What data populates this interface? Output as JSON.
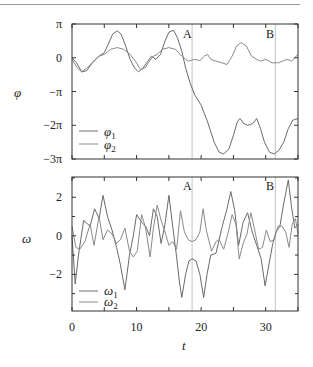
{
  "chart_data": [
    {
      "type": "line",
      "panel": "top",
      "ylabel": "φ",
      "xlabel": "",
      "xlim": [
        0,
        35
      ],
      "ylim_in_pi": [
        -3,
        1
      ],
      "yticks": [
        {
          "value_pi": 1,
          "label": "π"
        },
        {
          "value_pi": 0,
          "label": "0"
        },
        {
          "value_pi": -1,
          "label": "−π"
        },
        {
          "value_pi": -2,
          "label": "−2π"
        },
        {
          "value_pi": -3,
          "label": "−3π"
        }
      ],
      "xticks": [
        0,
        5,
        10,
        15,
        20,
        25,
        30,
        35
      ],
      "legend": {
        "position": "lower-left",
        "entries": [
          "φ1",
          "φ2"
        ]
      },
      "markers": [
        {
          "label": "A",
          "t": 18.6
        },
        {
          "label": "B",
          "t": 31.5
        }
      ],
      "series": [
        {
          "name": "φ1",
          "color": "#6a6a6a",
          "points_t_phi_over_pi": [
            [
              0,
              0
            ],
            [
              0.7,
              -0.15
            ],
            [
              1.5,
              -0.42
            ],
            [
              2.3,
              -0.38
            ],
            [
              3.2,
              -0.12
            ],
            [
              4.2,
              0.05
            ],
            [
              5,
              0.15
            ],
            [
              5.6,
              0.4
            ],
            [
              6.3,
              0.7
            ],
            [
              7,
              0.8
            ],
            [
              7.6,
              0.7
            ],
            [
              8.3,
              0.35
            ],
            [
              9,
              -0.05
            ],
            [
              9.7,
              -0.3
            ],
            [
              10.3,
              -0.42
            ],
            [
              11,
              -0.3
            ],
            [
              11.7,
              -0.12
            ],
            [
              12.3,
              0.05
            ],
            [
              13,
              -0.05
            ],
            [
              13.7,
              0.1
            ],
            [
              14.4,
              0.5
            ],
            [
              15,
              0.75
            ],
            [
              15.7,
              0.82
            ],
            [
              16.3,
              0.6
            ],
            [
              17,
              0.2
            ],
            [
              17.6,
              -0.3
            ],
            [
              18.3,
              -0.75
            ],
            [
              19,
              -1.1
            ],
            [
              20,
              -1.4
            ],
            [
              21,
              -1.9
            ],
            [
              22,
              -2.5
            ],
            [
              22.8,
              -2.8
            ],
            [
              23.5,
              -2.85
            ],
            [
              24.3,
              -2.7
            ],
            [
              25,
              -2.3
            ],
            [
              25.6,
              -1.9
            ],
            [
              26,
              -1.8
            ],
            [
              26.6,
              -1.95
            ],
            [
              27.2,
              -2.0
            ],
            [
              28,
              -1.95
            ],
            [
              28.6,
              -1.8
            ],
            [
              29.2,
              -2.1
            ],
            [
              29.8,
              -2.5
            ],
            [
              30.6,
              -2.8
            ],
            [
              31.3,
              -2.85
            ],
            [
              32,
              -2.75
            ],
            [
              32.8,
              -2.5
            ],
            [
              33.5,
              -2.1
            ],
            [
              34.2,
              -1.85
            ],
            [
              35,
              -1.8
            ]
          ]
        },
        {
          "name": "φ2",
          "color": "#8a8a8a",
          "points_t_phi_over_pi": [
            [
              0,
              -0.05
            ],
            [
              0.8,
              -0.3
            ],
            [
              1.5,
              -0.42
            ],
            [
              2.3,
              -0.3
            ],
            [
              3.2,
              -0.15
            ],
            [
              4.2,
              0.05
            ],
            [
              5,
              0.1
            ],
            [
              6,
              0.25
            ],
            [
              7,
              0.3
            ],
            [
              8,
              0.25
            ],
            [
              9,
              0.1
            ],
            [
              10,
              -0.15
            ],
            [
              10.6,
              -0.35
            ],
            [
              11.3,
              -0.3
            ],
            [
              12,
              -0.1
            ],
            [
              12.6,
              0.05
            ],
            [
              13.2,
              0.1
            ],
            [
              14,
              0.25
            ],
            [
              15,
              0.3
            ],
            [
              16,
              0.25
            ],
            [
              17,
              0.05
            ],
            [
              18,
              -0.1
            ],
            [
              19,
              -0.05
            ],
            [
              19.8,
              -0.08
            ],
            [
              20.5,
              0.05
            ],
            [
              21,
              0.1
            ],
            [
              21.5,
              -0.05
            ],
            [
              22.3,
              -0.1
            ],
            [
              23.2,
              -0.15
            ],
            [
              24,
              -0.2
            ],
            [
              24.8,
              0.05
            ],
            [
              25.5,
              0.35
            ],
            [
              26.2,
              0.45
            ],
            [
              27,
              0.35
            ],
            [
              27.8,
              0.05
            ],
            [
              28.6,
              -0.05
            ],
            [
              29.2,
              -0.1
            ],
            [
              30,
              -0.05
            ],
            [
              31,
              -0.15
            ],
            [
              32,
              -0.15
            ],
            [
              32.8,
              -0.08
            ],
            [
              33.4,
              -0.05
            ],
            [
              34,
              -0.1
            ],
            [
              35,
              0.1
            ]
          ]
        }
      ]
    },
    {
      "type": "line",
      "panel": "bottom",
      "ylabel": "ω",
      "xlabel": "t",
      "xlim": [
        0,
        35
      ],
      "ylim": [
        -3.9,
        3.05
      ],
      "yticks": [
        {
          "value": 2,
          "label": "2"
        },
        {
          "value": 0,
          "label": "0"
        },
        {
          "value": -2,
          "label": "−2"
        }
      ],
      "yminorticks": [
        3,
        1,
        -1,
        -3
      ],
      "xticks": [
        0,
        5,
        10,
        15,
        20,
        25,
        30,
        35
      ],
      "xticklabels": [
        {
          "value": 0,
          "label": "0"
        },
        {
          "value": 10,
          "label": "10"
        },
        {
          "value": 20,
          "label": "20"
        },
        {
          "value": 30,
          "label": "30"
        }
      ],
      "legend": {
        "position": "lower-left",
        "entries": [
          "ω1",
          "ω2"
        ]
      },
      "markers": [
        {
          "label": "A",
          "t": 18.6
        },
        {
          "label": "B",
          "t": 31.5
        }
      ],
      "series": [
        {
          "name": "ω1",
          "color": "#6a6a6a",
          "points_t_omega": [
            [
              0,
              0
            ],
            [
              0.5,
              -2.5
            ],
            [
              1,
              -1
            ],
            [
              1.8,
              0.8
            ],
            [
              2.8,
              0.5
            ],
            [
              3.5,
              1.4
            ],
            [
              4.2,
              0.9
            ],
            [
              4.8,
              2.1
            ],
            [
              5.5,
              1.0
            ],
            [
              6.2,
              0.3
            ],
            [
              6.9,
              -0.6
            ],
            [
              7.5,
              -1.5
            ],
            [
              8.2,
              -2.8
            ],
            [
              8.9,
              -1.0
            ],
            [
              9.5,
              0.0
            ],
            [
              10,
              1.1
            ],
            [
              10.8,
              0.7
            ],
            [
              11.4,
              0.5
            ],
            [
              12,
              0.0
            ],
            [
              12.6,
              1.4
            ],
            [
              13.2,
              1.0
            ],
            [
              13.8,
              -0.4
            ],
            [
              14.4,
              0.6
            ],
            [
              15,
              2.1
            ],
            [
              15.6,
              0.5
            ],
            [
              16.2,
              -1.1
            ],
            [
              16.6,
              -2.3
            ],
            [
              17,
              -3.2
            ],
            [
              17.6,
              -2.0
            ],
            [
              18.1,
              -1.3
            ],
            [
              18.6,
              -1.2
            ],
            [
              19.2,
              -1.3
            ],
            [
              19.8,
              -2.0
            ],
            [
              20.4,
              -3.2
            ],
            [
              20.9,
              -2.0
            ],
            [
              21.5,
              -1.0
            ],
            [
              22.3,
              -0.9
            ],
            [
              23.2,
              0.4
            ],
            [
              24,
              1.4
            ],
            [
              24.6,
              2.3
            ],
            [
              25.2,
              1.3
            ],
            [
              25.8,
              -0.5
            ],
            [
              26.5,
              0.7
            ],
            [
              27.2,
              1.2
            ],
            [
              27.9,
              0.2
            ],
            [
              28.6,
              -0.5
            ],
            [
              29.3,
              -1.2
            ],
            [
              29.9,
              -2.6
            ],
            [
              30.5,
              -1.5
            ],
            [
              31.1,
              -0.4
            ],
            [
              31.6,
              0.2
            ],
            [
              32.2,
              0.5
            ],
            [
              32.8,
              1.7
            ],
            [
              33.5,
              2.9
            ],
            [
              34,
              1.5
            ],
            [
              34.5,
              0.4
            ],
            [
              35,
              0.6
            ]
          ]
        },
        {
          "name": "ω2",
          "color": "#8a8a8a",
          "points_t_omega": [
            [
              0,
              0.5
            ],
            [
              0.6,
              -0.6
            ],
            [
              1.2,
              -0.7
            ],
            [
              2,
              -0.3
            ],
            [
              2.8,
              0.6
            ],
            [
              3.4,
              -0.5
            ],
            [
              4.2,
              1.0
            ],
            [
              4.8,
              -0.2
            ],
            [
              5.5,
              0.3
            ],
            [
              6.2,
              0.1
            ],
            [
              6.9,
              -0.4
            ],
            [
              7.5,
              -0.2
            ],
            [
              8.2,
              0.4
            ],
            [
              8.9,
              -0.8
            ],
            [
              9.5,
              -1.1
            ],
            [
              10.1,
              -0.8
            ],
            [
              10.8,
              1.1
            ],
            [
              11.4,
              0.4
            ],
            [
              12.1,
              -1.1
            ],
            [
              12.6,
              0.4
            ],
            [
              13.2,
              1.6
            ],
            [
              13.8,
              0.8
            ],
            [
              14.4,
              0.2
            ],
            [
              15,
              -0.5
            ],
            [
              15.6,
              -0.3
            ],
            [
              16.2,
              -0.7
            ],
            [
              16.8,
              1.3
            ],
            [
              17.4,
              0.2
            ],
            [
              18,
              -0.2
            ],
            [
              18.6,
              -0.3
            ],
            [
              19.2,
              -0.2
            ],
            [
              19.8,
              0.2
            ],
            [
              20.3,
              1.4
            ],
            [
              20.8,
              0.3
            ],
            [
              21.6,
              -0.8
            ],
            [
              22.3,
              -0.3
            ],
            [
              22.8,
              -0.2
            ],
            [
              23.5,
              -0.7
            ],
            [
              24.2,
              0.2
            ],
            [
              24.8,
              1.1
            ],
            [
              25.4,
              0.6
            ],
            [
              25.9,
              -1.2
            ],
            [
              26.5,
              -0.4
            ],
            [
              27.1,
              0.1
            ],
            [
              27.7,
              1.2
            ],
            [
              28.3,
              0.3
            ],
            [
              28.9,
              -0.7
            ],
            [
              29.5,
              -0.6
            ],
            [
              30.1,
              0.3
            ],
            [
              30.7,
              -0.3
            ],
            [
              31.3,
              -0.2
            ],
            [
              31.9,
              0.5
            ],
            [
              32.5,
              0.5
            ],
            [
              33.1,
              0.2
            ],
            [
              33.6,
              -0.6
            ],
            [
              34.1,
              0.6
            ],
            [
              34.6,
              0.9
            ],
            [
              35,
              0.1
            ]
          ]
        }
      ]
    }
  ],
  "labels": {
    "top_ylabel": "φ",
    "bottom_ylabel": "ω",
    "xlabel": "t",
    "marker_a": "A",
    "marker_b": "B",
    "legend_top_1": "φ",
    "legend_top_1_sub": "1",
    "legend_top_2": "φ",
    "legend_top_2_sub": "2",
    "legend_bottom_1": "ω",
    "legend_bottom_1_sub": "1",
    "legend_bottom_2": "ω",
    "legend_bottom_2_sub": "2"
  }
}
